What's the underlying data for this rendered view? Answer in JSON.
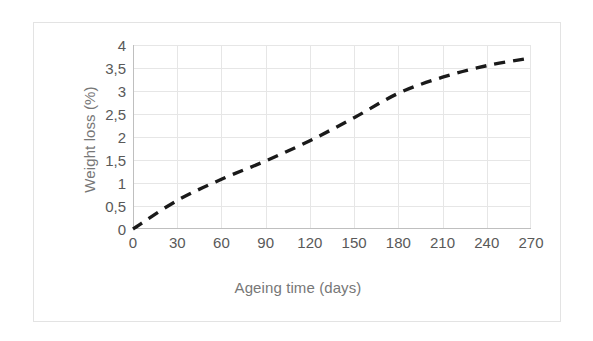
{
  "chart_data": {
    "type": "line",
    "title": "",
    "xlabel": "Ageing time (days)",
    "ylabel": "Weight loss (%)",
    "xlim": [
      0,
      270
    ],
    "ylim": [
      0,
      4
    ],
    "grid": true,
    "legend": false,
    "line_style": "dashed",
    "line_color": "#1a1a1a",
    "line_width_px": 3.4,
    "x_ticks": [
      0,
      30,
      60,
      90,
      120,
      150,
      180,
      210,
      240,
      270
    ],
    "x_tick_labels": [
      "0",
      "30",
      "60",
      "90",
      "120",
      "150",
      "180",
      "210",
      "240",
      "270"
    ],
    "y_ticks": [
      0,
      0.5,
      1,
      1.5,
      2,
      2.5,
      3,
      3.5,
      4
    ],
    "y_tick_labels": [
      "0",
      "0,5",
      "1",
      "1,5",
      "2",
      "2,5",
      "3",
      "3,5",
      "4"
    ],
    "series": [
      {
        "name": "Weight loss",
        "x": [
          0,
          30,
          60,
          90,
          120,
          150,
          180,
          210,
          240,
          270
        ],
        "values": [
          0,
          0.62,
          1.08,
          1.48,
          1.92,
          2.42,
          2.95,
          3.3,
          3.55,
          3.72
        ]
      }
    ]
  },
  "colors": {
    "frame_border": "#e3e3e3",
    "gridline": "#e6e6e6",
    "axis_line": "#bfbfbf",
    "tick_text": "#595959",
    "axis_title_text": "#777777",
    "series_line": "#1a1a1a",
    "background": "#ffffff"
  }
}
